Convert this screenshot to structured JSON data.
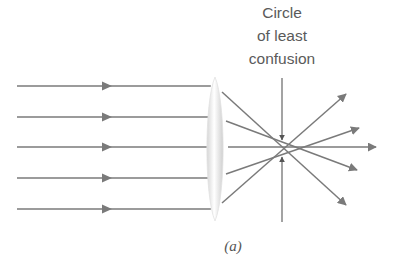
{
  "figure": {
    "label": {
      "lines": [
        "Circle",
        "of least",
        "confusion"
      ]
    },
    "caption": "(a)",
    "colors": {
      "ray": "#7a7a7a",
      "lens_fill_center": "#ffffff",
      "lens_fill_edge": "#d8d8d8",
      "text": "#5a5a5a",
      "background": "#ffffff"
    },
    "incoming_rays": [
      {
        "y": 86
      },
      {
        "y": 117
      },
      {
        "y": 147
      },
      {
        "y": 178
      },
      {
        "y": 209
      }
    ],
    "lens": {
      "cx": 215,
      "top": 77,
      "bottom": 221,
      "half_width": 8
    },
    "outgoing_rays": [
      {
        "x1": 222,
        "y1": 92,
        "x2": 346,
        "y2": 205
      },
      {
        "x1": 226,
        "y1": 121,
        "x2": 357,
        "y2": 170
      },
      {
        "x1": 228,
        "y1": 147,
        "x2": 376,
        "y2": 147
      },
      {
        "x1": 226,
        "y1": 174,
        "x2": 359,
        "y2": 128
      },
      {
        "x1": 222,
        "y1": 203,
        "x2": 346,
        "y2": 94
      }
    ],
    "indicator": {
      "x": 282,
      "top_y1": 78,
      "top_y2": 140,
      "bottom_y1": 222,
      "bottom_y2": 157
    }
  }
}
